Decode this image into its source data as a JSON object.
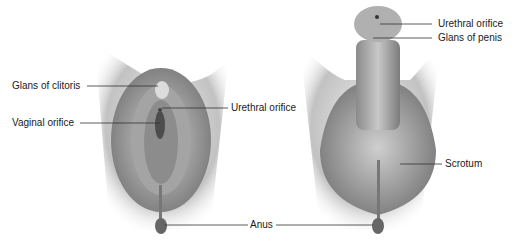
{
  "figure": {
    "left_panel": {
      "labels": [
        {
          "id": "glans-clitoris",
          "text": "Glans of clitoris"
        },
        {
          "id": "urethral-orifice-f",
          "text": "Urethral orifice"
        },
        {
          "id": "vaginal-orifice",
          "text": "Vaginal orifice"
        }
      ]
    },
    "right_panel": {
      "labels": [
        {
          "id": "urethral-orifice-m",
          "text": "Urethral orifice"
        },
        {
          "id": "glans-penis",
          "text": "Glans of penis"
        },
        {
          "id": "scrotum",
          "text": "Scrotum"
        }
      ]
    },
    "shared_labels": [
      {
        "id": "anus",
        "text": "Anus"
      }
    ],
    "colors": {
      "illustration_gray": "#9a9a9a",
      "shadow_gray": "#6e6e6e",
      "light_gray": "#d4d4d4",
      "line": "#333333"
    }
  }
}
